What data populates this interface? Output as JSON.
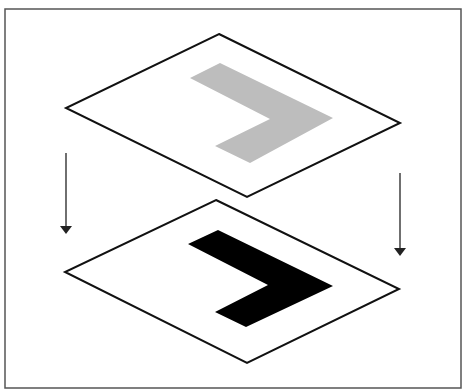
{
  "diagram": {
    "title": "",
    "frame": {
      "x": 5,
      "y": 9,
      "width": 456,
      "height": 379,
      "stroke": "#555555"
    },
    "colors": {
      "plane_fill": "#ffffff",
      "plane_stroke": "#111111",
      "top_shape_fill": "#bdbdbd",
      "bottom_shape_fill": "#000000",
      "arrow": "#222222"
    },
    "planes": [
      {
        "name": "top-plane",
        "points": "219,34 400,123 247,197 66,108",
        "shape": {
          "name": "gray-chevron",
          "points": "190,78 220,63 333,118 250,163 215,146 270,119"
        }
      },
      {
        "name": "bottom-plane",
        "points": "216,200 399,289 247,363 65,272",
        "shape": {
          "name": "black-chevron",
          "points": "188,244 218,230 333,286 246,327 215,312 268,285"
        }
      }
    ],
    "arrows": [
      {
        "name": "left-down-arrow",
        "x": 66,
        "y1": 153,
        "y2": 226,
        "head": "60,226 72,226 66,234"
      },
      {
        "name": "right-down-arrow",
        "x": 400,
        "y1": 173,
        "y2": 248,
        "head": "394,248 406,248 400,256"
      }
    ]
  }
}
